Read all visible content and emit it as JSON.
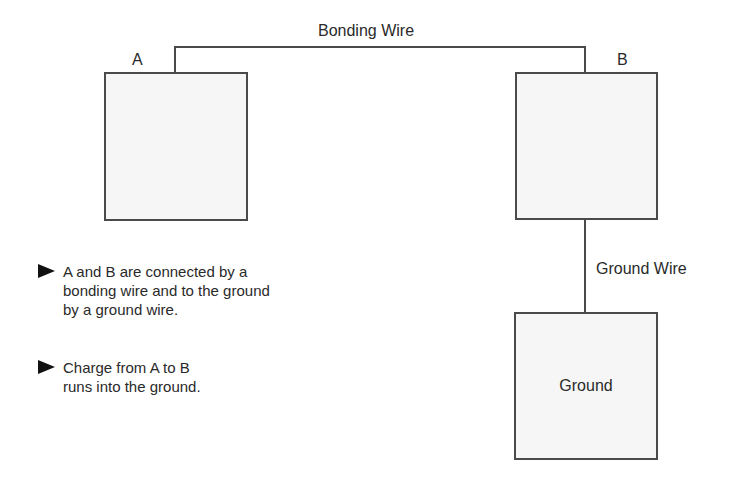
{
  "diagram": {
    "wires": {
      "bonding_label": "Bonding Wire",
      "ground_label": "Ground Wire"
    },
    "nodes": {
      "a_label": "A",
      "b_label": "B",
      "ground_label": "Ground"
    },
    "notes": [
      {
        "icon": "triangle-right-icon",
        "text": "A and B are connected by a bonding wire and to the ground by a ground wire."
      },
      {
        "icon": "triangle-right-icon",
        "text": "Charge from A to B runs into the ground."
      }
    ],
    "colors": {
      "box_fill": "#f6f6f6",
      "line": "#4a4a4a",
      "text": "#2a2a2a"
    }
  }
}
